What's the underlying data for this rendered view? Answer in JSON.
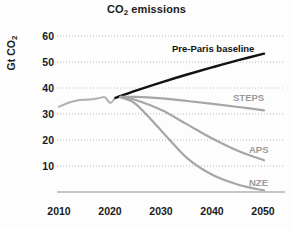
{
  "chart_data": {
    "type": "line",
    "title": "CO2 emissions",
    "title_parts": {
      "pre": "CO",
      "sub": "2",
      "post": " emissions"
    },
    "xlabel": "",
    "ylabel": "Gt CO2",
    "ylabel_parts": {
      "pre": "Gt CO",
      "sub": "2"
    },
    "xlim": [
      2008,
      2052
    ],
    "ylim": [
      0,
      64
    ],
    "x_ticks": [
      "2010",
      "2020",
      "2030",
      "2040",
      "2050"
    ],
    "x_tick_values": [
      2010,
      2020,
      2030,
      2040,
      2050
    ],
    "y_ticks": [
      "10",
      "20",
      "30",
      "40",
      "50",
      "60"
    ],
    "y_tick_values": [
      10,
      20,
      30,
      40,
      50,
      60
    ],
    "grid": "horizontal-dotted",
    "legend_position": "inline-right",
    "series": [
      {
        "name": "Historical",
        "label": "",
        "color": "#b0b0b0",
        "width": 2.0,
        "x": [
          2010,
          2012,
          2014,
          2016,
          2018,
          2019,
          2020,
          2021,
          2022
        ],
        "values": [
          32.8,
          34.4,
          35.4,
          35.6,
          36.2,
          36.4,
          34.2,
          36.1,
          36.6
        ]
      },
      {
        "name": "Pre-Paris baseline",
        "label": "Pre-Paris baseline",
        "color": "#121212",
        "width": 2.4,
        "x": [
          2021,
          2025,
          2030,
          2035,
          2040,
          2045,
          2050
        ],
        "values": [
          36.2,
          39.0,
          42.2,
          45.2,
          48.0,
          50.7,
          53.2
        ]
      },
      {
        "name": "STEPS",
        "label": "STEPS",
        "color": "#a6a6a6",
        "width": 2.2,
        "x": [
          2022,
          2025,
          2030,
          2035,
          2040,
          2045,
          2050
        ],
        "values": [
          36.6,
          36.6,
          36.0,
          35.0,
          33.9,
          32.7,
          31.4
        ]
      },
      {
        "name": "APS",
        "label": "APS",
        "color": "#a6a6a6",
        "width": 2.2,
        "x": [
          2022,
          2025,
          2030,
          2035,
          2040,
          2045,
          2050
        ],
        "values": [
          36.6,
          35.4,
          31.5,
          26.0,
          20.5,
          15.8,
          12.2
        ]
      },
      {
        "name": "NZE",
        "label": "NZE",
        "color": "#a6a6a6",
        "width": 2.2,
        "x": [
          2022,
          2025,
          2030,
          2035,
          2040,
          2045,
          2050
        ],
        "values": [
          36.4,
          33.8,
          23.5,
          13.0,
          6.5,
          2.8,
          0.6
        ]
      }
    ],
    "annotations": [
      {
        "text": "Pre-Paris baseline",
        "x": 2036,
        "y": 56.0
      },
      {
        "text": "STEPS",
        "x": 2047,
        "y": 37.0
      },
      {
        "text": "APS",
        "x": 2047,
        "y": 17.5
      },
      {
        "text": "NZE",
        "x": 2047,
        "y": 5.5
      }
    ],
    "colors": {
      "baseline": "#121212",
      "scenario": "#a6a6a6",
      "historical": "#b0b0b0",
      "grid": "#b9b9b9",
      "axis": "#8e8e8e",
      "text": "#1a1a1a",
      "label_grey": "#9a9a9a"
    }
  }
}
